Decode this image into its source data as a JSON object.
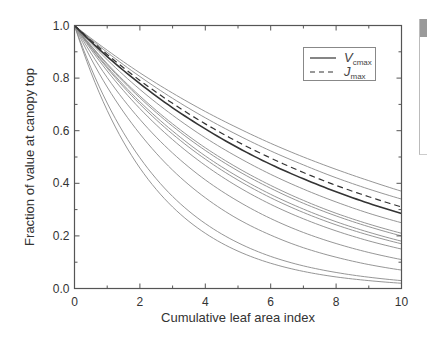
{
  "chart_data": {
    "type": "line",
    "title": "",
    "xlabel": "Cumulative leaf area index",
    "ylabel": "Fraction of value at canopy top",
    "xlim": [
      0,
      10
    ],
    "ylim": [
      0.0,
      1.0
    ],
    "xticks": [
      "0",
      "2",
      "4",
      "6",
      "8",
      "10"
    ],
    "yticks": [
      "0.0",
      "0.2",
      "0.4",
      "0.6",
      "0.8",
      "1.0"
    ],
    "grid": false,
    "legend_position": "upper right",
    "legend": [
      {
        "label": "V",
        "sub": "cmax",
        "style": "solid"
      },
      {
        "label": "J",
        "sub": "max",
        "style": "dashed"
      }
    ],
    "x": [
      0,
      1,
      2,
      3,
      4,
      5,
      6,
      7,
      8,
      9,
      10
    ],
    "series": [
      {
        "name": "curve-1",
        "style": "thin",
        "values": [
          1.0,
          0.906,
          0.82,
          0.743,
          0.673,
          0.61,
          0.552,
          0.5,
          0.453,
          0.41,
          0.37
        ]
      },
      {
        "name": "curve-2",
        "style": "thin",
        "values": [
          1.0,
          0.898,
          0.806,
          0.723,
          0.649,
          0.583,
          0.523,
          0.47,
          0.421,
          0.378,
          0.34
        ]
      },
      {
        "name": "Jmax",
        "style": "dashed",
        "values": [
          1.0,
          0.89,
          0.791,
          0.704,
          0.626,
          0.557,
          0.496,
          0.441,
          0.392,
          0.349,
          0.31
        ]
      },
      {
        "name": "Vcmax",
        "style": "bold",
        "values": [
          1.0,
          0.882,
          0.779,
          0.687,
          0.607,
          0.535,
          0.472,
          0.417,
          0.368,
          0.324,
          0.285
        ]
      },
      {
        "name": "curve-5",
        "style": "thin",
        "values": [
          1.0,
          0.87,
          0.757,
          0.659,
          0.573,
          0.499,
          0.434,
          0.378,
          0.329,
          0.286,
          0.25
        ]
      },
      {
        "name": "curve-6",
        "style": "thin",
        "values": [
          1.0,
          0.855,
          0.732,
          0.626,
          0.535,
          0.458,
          0.392,
          0.335,
          0.286,
          0.245,
          0.21
        ]
      },
      {
        "name": "curve-7",
        "style": "thin",
        "values": [
          1.0,
          0.851,
          0.725,
          0.617,
          0.525,
          0.447,
          0.381,
          0.324,
          0.276,
          0.235,
          0.2
        ]
      },
      {
        "name": "curve-8",
        "style": "thin",
        "values": [
          1.0,
          0.843,
          0.71,
          0.599,
          0.504,
          0.425,
          0.358,
          0.302,
          0.254,
          0.214,
          0.18
        ]
      },
      {
        "name": "curve-9",
        "style": "thin",
        "values": [
          1.0,
          0.838,
          0.701,
          0.587,
          0.492,
          0.412,
          0.345,
          0.289,
          0.242,
          0.203,
          0.17
        ]
      },
      {
        "name": "curve-10",
        "style": "thin",
        "values": [
          1.0,
          0.827,
          0.684,
          0.566,
          0.468,
          0.387,
          0.32,
          0.265,
          0.219,
          0.181,
          0.15
        ]
      },
      {
        "name": "curve-11",
        "style": "thin",
        "values": [
          1.0,
          0.802,
          0.643,
          0.515,
          0.413,
          0.332,
          0.266,
          0.213,
          0.171,
          0.137,
          0.11
        ]
      },
      {
        "name": "curve-12",
        "style": "thin",
        "values": [
          1.0,
          0.766,
          0.588,
          0.45,
          0.345,
          0.264,
          0.203,
          0.155,
          0.119,
          0.091,
          0.07
        ]
      },
      {
        "name": "curve-13",
        "style": "thin",
        "values": [
          1.0,
          0.705,
          0.497,
          0.35,
          0.247,
          0.174,
          0.122,
          0.086,
          0.061,
          0.043,
          0.03
        ]
      },
      {
        "name": "curve-14",
        "style": "thin",
        "values": [
          1.0,
          0.677,
          0.458,
          0.31,
          0.21,
          0.142,
          0.096,
          0.065,
          0.044,
          0.03,
          0.02
        ]
      }
    ]
  },
  "colors": {
    "axis": "#555555",
    "thin_line": "#8a8a8a",
    "bold_line": "#333333",
    "dashed_line": "#333333",
    "side_block": "#9a9a9a"
  }
}
